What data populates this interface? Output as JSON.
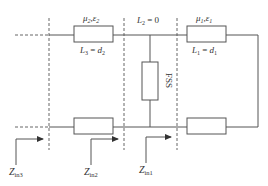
{
  "diagram": {
    "type": "equivalent-circuit",
    "colors": {
      "line": "#555555",
      "dashed": "#666666",
      "text": "#333333",
      "background": "#ffffff"
    },
    "layers": [
      {
        "id": "layer2",
        "material_label": "μ2,ε2",
        "material_mu": "μ",
        "material_mu_sub": "2",
        "material_eps": "ε",
        "material_eps_sub": "2",
        "length_label": "L3 = d2",
        "length_L": "L",
        "length_L_sub": "3",
        "length_eq": " = ",
        "length_d": "d",
        "length_d_sub": "2"
      },
      {
        "id": "layer1",
        "material_label": "μ1,ε1",
        "material_mu": "μ",
        "material_mu_sub": "1",
        "material_eps": "ε",
        "material_eps_sub": "1",
        "length_label": "L1 = d1",
        "length_L": "L",
        "length_L_sub": "1",
        "length_eq": " = ",
        "length_d": "d",
        "length_d_sub": "1"
      }
    ],
    "fss": {
      "label": "FSS",
      "length_label": "L2 = 0",
      "length_L": "L",
      "length_L_sub": "2",
      "length_rest": " = 0"
    },
    "impedances": [
      {
        "label": "Zin3",
        "Z": "Z",
        "sub": "in3"
      },
      {
        "label": "Zin2",
        "Z": "Z",
        "sub": "in2"
      },
      {
        "label": "Zin1",
        "Z": "Z",
        "sub": "in1"
      }
    ]
  }
}
